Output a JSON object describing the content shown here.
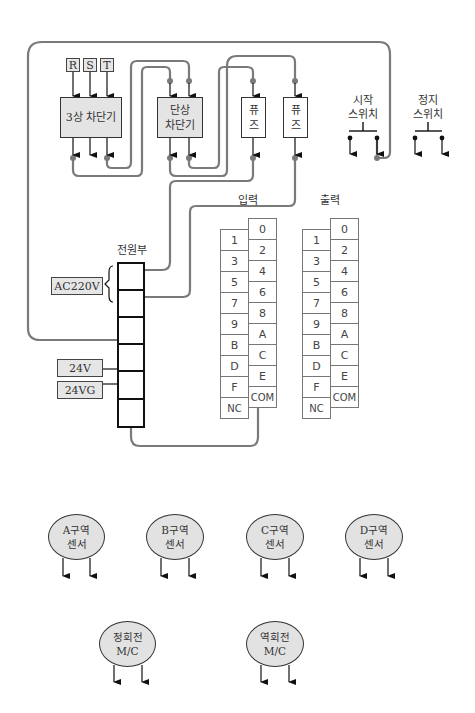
{
  "phases": [
    "R",
    "S",
    "T"
  ],
  "breakers": {
    "three_phase": "3상 차단기",
    "single_phase_line1": "단상",
    "single_phase_line2": "차단기"
  },
  "fuses": [
    {
      "line1": "퓨",
      "line2": "즈"
    },
    {
      "line1": "퓨",
      "line2": "즈"
    }
  ],
  "switches": {
    "start_line1": "시작",
    "start_line2": "스위치",
    "stop_line1": "정지",
    "stop_line2": "스위치"
  },
  "power_supply": {
    "title": "전원부",
    "ac_label": "AC220V",
    "v24_label": "24V",
    "v24g_label": "24VG"
  },
  "input_terminal": {
    "title": "입력",
    "left": [
      "1",
      "3",
      "5",
      "7",
      "9",
      "B",
      "D",
      "F",
      "NC"
    ],
    "right": [
      "0",
      "2",
      "4",
      "6",
      "8",
      "A",
      "C",
      "E",
      "COM"
    ]
  },
  "output_terminal": {
    "title": "출력",
    "left": [
      "1",
      "3",
      "5",
      "7",
      "9",
      "B",
      "D",
      "F",
      "NC"
    ],
    "right": [
      "0",
      "2",
      "4",
      "6",
      "8",
      "A",
      "C",
      "E",
      "COM"
    ]
  },
  "sensors": [
    {
      "line1": "A구역",
      "line2": "센서"
    },
    {
      "line1": "B구역",
      "line2": "센서"
    },
    {
      "line1": "C구역",
      "line2": "센서"
    },
    {
      "line1": "D구역",
      "line2": "센서"
    }
  ],
  "contactors": [
    {
      "line1": "정회전",
      "line2": "M/C"
    },
    {
      "line1": "역회전",
      "line2": "M/C"
    }
  ],
  "colors": {
    "wire": "#7a7a7a",
    "box_fill": "#e4e4e4",
    "ellipse_fill": "#e2e2e2",
    "psu_border": "#111111"
  }
}
